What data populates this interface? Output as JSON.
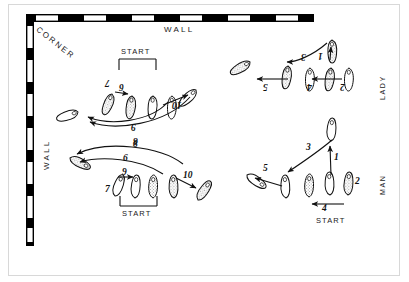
{
  "diagram": {
    "title_labels": {
      "wall_top": "WALL",
      "wall_left": "WALL",
      "corner": "CORNER",
      "lady": "LADY",
      "man": "MAN",
      "start": "START"
    },
    "colors": {
      "ink": "#111111",
      "wall_dark": "#000000",
      "wall_light": "#ffffff",
      "frame": "#d8d8d8",
      "paper": "#ffffff"
    },
    "quadrants": [
      {
        "id": "lady-upper-left",
        "name": "lady-steps-6-10",
        "orientation": "inverted",
        "start_label": "START",
        "steps": [
          "7",
          "6",
          "9",
          "8",
          "10"
        ]
      },
      {
        "id": "man-lower-left",
        "name": "man-steps-6-10",
        "orientation": "upright",
        "start_label": "START",
        "steps": [
          "8",
          "6",
          "9",
          "7",
          "10"
        ]
      },
      {
        "id": "lady-upper-right",
        "name": "lady-steps-1-5",
        "orientation": "inverted",
        "start_label": "",
        "steps": [
          "1",
          "2",
          "3",
          "4",
          "5"
        ]
      },
      {
        "id": "man-lower-right",
        "name": "man-steps-1-5",
        "orientation": "upright",
        "start_label": "START",
        "steps": [
          "1",
          "2",
          "3",
          "4",
          "5"
        ]
      }
    ],
    "step_numbers": {
      "ul_7": "7",
      "ul_6": "6",
      "ul_9": "9",
      "ul_8": "8",
      "ul_10": "10",
      "ll_8": "8",
      "ll_6": "6",
      "ll_9": "9",
      "ll_7": "7",
      "ll_10": "10",
      "ur_1": "1",
      "ur_2": "2",
      "ur_3": "3",
      "ur_4": "4",
      "ur_5": "5",
      "lr_1": "1",
      "lr_2": "2",
      "lr_3": "3",
      "lr_4": "4",
      "lr_5": "5"
    }
  }
}
